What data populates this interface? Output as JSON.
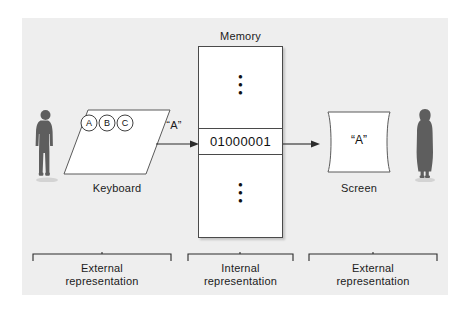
{
  "figure": {
    "background_color": "#eeeeee",
    "line_color": "#4a4a4a",
    "text_color": "#1b1b1b"
  },
  "memory": {
    "label": "Memory",
    "cell_value": "01000001",
    "ellipsis_top": "⋮",
    "ellipsis_bottom": "⋮"
  },
  "keyboard": {
    "label": "Keyboard",
    "keys": [
      {
        "letter": "A"
      },
      {
        "letter": "B"
      },
      {
        "letter": "C"
      }
    ]
  },
  "screen": {
    "label": "Screen",
    "display_text": "“A”"
  },
  "signals": {
    "keyboard_to_memory_label": "“A”"
  },
  "people": {
    "left": "man-silhouette",
    "right": "woman-silhouette"
  },
  "brackets": [
    {
      "label": "External\nrepresentation"
    },
    {
      "label": "Internal\nrepresentation"
    },
    {
      "label": "External\nrepresentation"
    }
  ]
}
